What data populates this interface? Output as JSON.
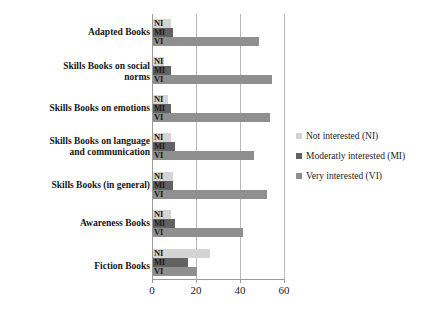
{
  "chart_data": {
    "type": "bar",
    "orientation": "horizontal",
    "title": "",
    "subtitle": "",
    "xlabel": "",
    "ylabel": "",
    "xlim": [
      0,
      60
    ],
    "xticks": [
      "0",
      "20",
      "40",
      "60"
    ],
    "xtick_values": [
      0,
      20,
      40,
      60
    ],
    "grid": "vertical",
    "legend_position": "right",
    "categories": [
      "Adapted Books",
      "Skills Books on social norms",
      "Skills Books on emotions",
      "Skills Books on language and communication",
      "Skills Books (in general)",
      "Awareness Books",
      "Fiction Books"
    ],
    "series": [
      {
        "name": "Not interested (NI)",
        "abbr": "NI",
        "color": "#d4d4d4",
        "values": [
          8,
          5,
          7,
          8,
          9,
          8,
          26
        ]
      },
      {
        "name": "Moderatly interested (MI)",
        "abbr": "MI",
        "color": "#626262",
        "values": [
          9,
          8,
          8,
          10,
          9,
          10,
          16
        ]
      },
      {
        "name": "Very interested (VI)",
        "abbr": "VI",
        "color": "#8f8f8f",
        "values": [
          48,
          54,
          53,
          46,
          52,
          41,
          20
        ]
      }
    ]
  },
  "axis": {
    "tick_0": "0",
    "tick_1": "20",
    "tick_2": "40",
    "tick_3": "60"
  },
  "categories": {
    "c0_line0": "Adapted Books",
    "c0_line1": "",
    "c1_line0": "Skills Books on social",
    "c1_line1": "norms",
    "c2_line0": "Skills Books on emotions",
    "c2_line1": "",
    "c3_line0": "Skills Books on language",
    "c3_line1": "and communication",
    "c4_line0": "Skills Books (in general)",
    "c4_line1": "",
    "c5_line0": "Awareness Books",
    "c5_line1": "",
    "c6_line0": "Fiction Books",
    "c6_line1": ""
  },
  "bar_labels": {
    "ni": "NI",
    "mi": "MI",
    "vi": "VI"
  },
  "legend": {
    "items": [
      {
        "label": "Not interested (NI)",
        "color": "#d4d4d4"
      },
      {
        "label": "Moderatly interested (MI)",
        "color": "#626262"
      },
      {
        "label": "Very interested (VI)",
        "color": "#8f8f8f"
      }
    ]
  }
}
